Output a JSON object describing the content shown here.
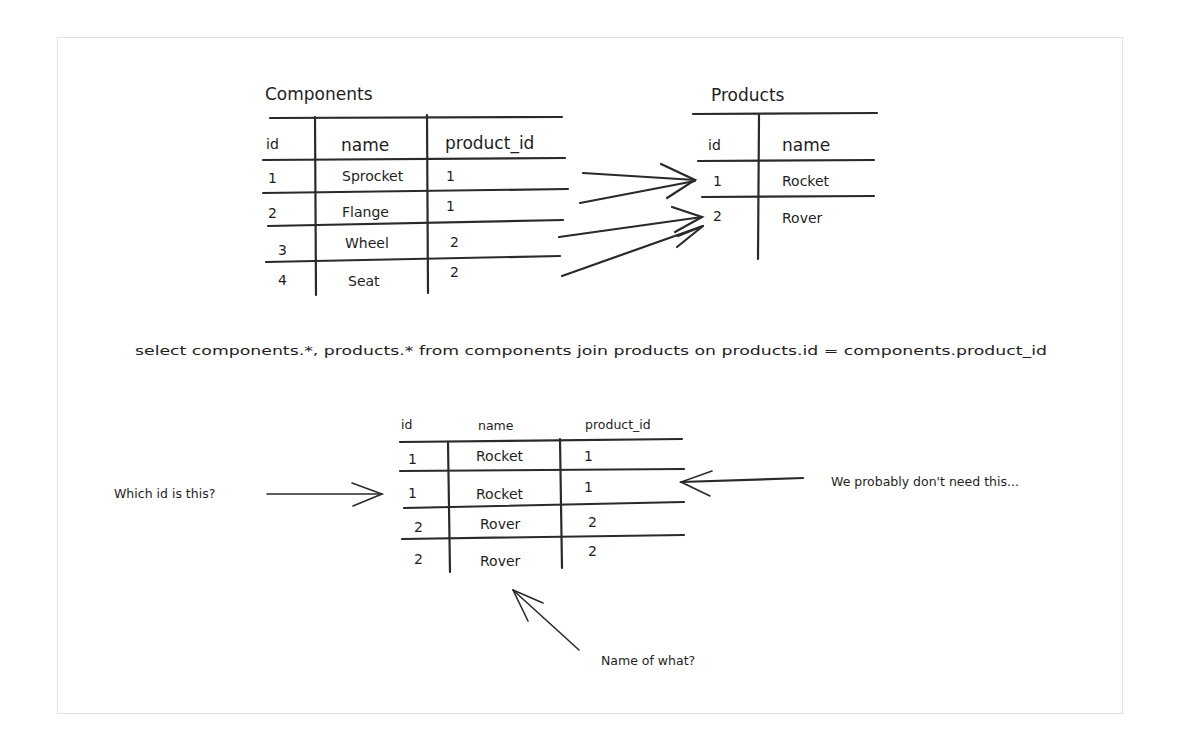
{
  "components_table": {
    "title": "Components",
    "headers": [
      "id",
      "name",
      "product_id"
    ],
    "rows": [
      [
        "1",
        "Sprocket",
        "1"
      ],
      [
        "2",
        "Flange",
        "1"
      ],
      [
        "3",
        "Wheel",
        "2"
      ],
      [
        "4",
        "Seat",
        "2"
      ]
    ]
  },
  "products_table": {
    "title": "Products",
    "headers": [
      "id",
      "name"
    ],
    "rows": [
      [
        "1",
        "Rocket"
      ],
      [
        "2",
        "Rover"
      ]
    ]
  },
  "query": {
    "sql": "select components.*, products.* from components join products on products.id = components.product_id"
  },
  "result_table": {
    "headers": [
      "id",
      "name",
      "product_id"
    ],
    "rows": [
      [
        "1",
        "Rocket",
        "1"
      ],
      [
        "1",
        "Rocket",
        "1"
      ],
      [
        "2",
        "Rover",
        "2"
      ],
      [
        "2",
        "Rover",
        "2"
      ]
    ]
  },
  "annotations": {
    "which_id": "Which id is this?",
    "dont_need": "We probably don't need this...",
    "name_of_what": "Name of what?"
  },
  "colors": {
    "ink": "#1e1e1e",
    "frame": "#e2e2e2",
    "background": "#ffffff"
  }
}
